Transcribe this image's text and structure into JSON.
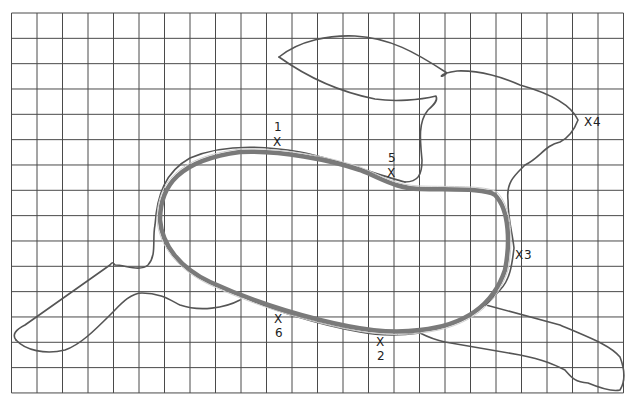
{
  "diagram": {
    "grid": {
      "x0": 11.5,
      "y0": 13,
      "columns": 24,
      "rows": 15,
      "cell_width": 25.5,
      "cell_height": 25.33,
      "line_color": "#4a4a4a"
    },
    "colors": {
      "outline": "#555555",
      "body_loop": "#7a7a7a",
      "label": "#222222"
    },
    "markers": [
      {
        "id": "1",
        "text": "1",
        "mark": "X",
        "label_pos": "above",
        "x": 278,
        "y": 141
      },
      {
        "id": "2",
        "text": "2",
        "mark": "X",
        "label_pos": "below",
        "x": 381,
        "y": 341
      },
      {
        "id": "3",
        "text": "3",
        "mark": "X",
        "label_pos": "right",
        "x": 521,
        "y": 254
      },
      {
        "id": "4",
        "text": "4",
        "mark": "X",
        "label_pos": "right",
        "x": 590,
        "y": 122
      },
      {
        "id": "5",
        "text": "5",
        "mark": "X",
        "label_pos": "above",
        "x": 392,
        "y": 172
      },
      {
        "id": "6",
        "text": "6",
        "mark": "X",
        "label_pos": "below",
        "x": 279,
        "y": 318
      }
    ]
  }
}
